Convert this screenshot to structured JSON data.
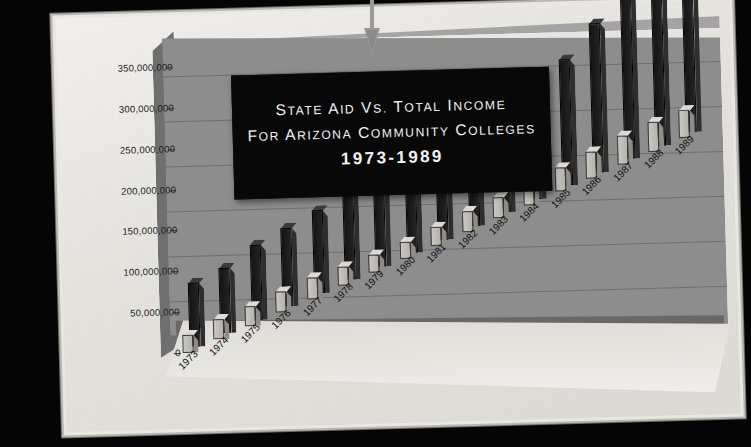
{
  "page": {
    "background_color": "#050505",
    "paper_color": "#eceae5"
  },
  "title": {
    "line1": "State Aid vs. Total Income",
    "line2": "for Arizona Community Colleges",
    "line3": "1973-1989",
    "plaque_background": "#080808",
    "text_color": "#f2f2f2"
  },
  "annotation": {
    "arrow_name": "down-arrow-pointer",
    "arrow_color": "#9a9a9a"
  },
  "axes": {
    "y_ticks": [
      "0",
      "50,000,000",
      "100,000,000",
      "150,000,000",
      "200,000,000",
      "250,000,000",
      "300,000,000",
      "350,000,000"
    ],
    "x_labels": [
      "1973",
      "1974",
      "1975",
      "1976",
      "1977",
      "1978",
      "1979",
      "1980",
      "1981",
      "1982",
      "1983",
      "1984",
      "1985",
      "1986",
      "1987",
      "1988",
      "1989"
    ]
  },
  "chart_data": {
    "type": "bar",
    "title": "State Aid vs. Total Income for Arizona Community Colleges 1973-1989",
    "xlabel": "",
    "ylabel": "",
    "ylim": [
      0,
      350000000
    ],
    "ytick_step": 50000000,
    "grid": true,
    "legend_position": "none",
    "projection": "3d",
    "categories": [
      "1973",
      "1974",
      "1975",
      "1976",
      "1977",
      "1978",
      "1979",
      "1980",
      "1981",
      "1982",
      "1983",
      "1984",
      "1985",
      "1986",
      "1987",
      "1988",
      "1989"
    ],
    "series": [
      {
        "name": "State Aid",
        "color": "#c1bfb9",
        "values": [
          22000000,
          25000000,
          24000000,
          26000000,
          27000000,
          24000000,
          22000000,
          21000000,
          23000000,
          26000000,
          26000000,
          29000000,
          30000000,
          33000000,
          36000000,
          36000000,
          34000000
        ]
      },
      {
        "name": "Total Income",
        "color": "#1a1a1a",
        "values": [
          78000000,
          80000000,
          92000000,
          96000000,
          101000000,
          108000000,
          110000000,
          119000000,
          135000000,
          142000000,
          147000000,
          152000000,
          154000000,
          182000000,
          248000000,
          232000000,
          265000000
        ]
      }
    ]
  }
}
